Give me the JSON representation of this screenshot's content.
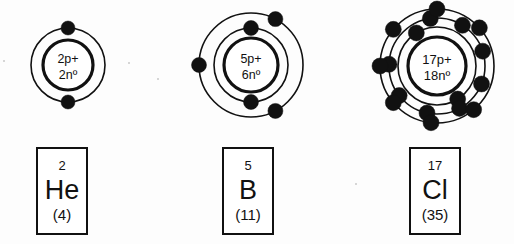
{
  "diagram": {
    "background_color": "#fdfdfd",
    "ink_color": "#111111",
    "atoms": [
      {
        "name": "helium-atom",
        "element_symbol": "He",
        "atomic_number": "2",
        "mass_number": "(4)",
        "protons_label": "2p+",
        "neutrons_label": "2nº",
        "center": {
          "x": 68,
          "y": 65
        },
        "nucleus_radius": 25,
        "shells": [
          {
            "radius": 37,
            "electron_count": 2,
            "electron_angles": [
              -90,
              90
            ]
          }
        ],
        "electron_radius": 7,
        "box": {
          "x": 36,
          "y": 147,
          "width": 52,
          "height": 88
        }
      },
      {
        "name": "boron-atom",
        "element_symbol": "B",
        "atomic_number": "5",
        "mass_number": "(11)",
        "protons_label": "5p+",
        "neutrons_label": "6nº",
        "center": {
          "x": 251,
          "y": 65
        },
        "nucleus_radius": 27,
        "shells": [
          {
            "radius": 37,
            "electron_count": 2,
            "electron_angles": [
              -90,
              90
            ]
          },
          {
            "radius": 52,
            "electron_count": 3,
            "electron_angles": [
              -62,
              180,
              62
            ]
          }
        ],
        "electron_radius": 7.5,
        "box": {
          "x": 222,
          "y": 147,
          "width": 52,
          "height": 88
        }
      },
      {
        "name": "chlorine-atom",
        "element_symbol": "Cl",
        "atomic_number": "17",
        "mass_number": "(35)",
        "protons_label": "17p+",
        "neutrons_label": "18nº",
        "center": {
          "x": 437,
          "y": 66
        },
        "nucleus_radius": 29,
        "shells": [
          {
            "radius": 39,
            "electron_count": 2,
            "electron_angles": [
              -122,
              58
            ]
          },
          {
            "radius": 48,
            "electron_count": 8,
            "electron_angles": [
              -98,
              -58,
              -18,
              22,
              62,
              102,
              142,
              182
            ]
          },
          {
            "radius": 57,
            "electron_count": 7,
            "electron_angles": [
              -90,
              -140,
              -180,
              140,
              96,
              50,
              -42
            ]
          }
        ],
        "electron_radius": 8,
        "box": {
          "x": 409,
          "y": 147,
          "width": 52,
          "height": 88
        }
      }
    ],
    "specks": [
      {
        "x": 128,
        "y": 62,
        "size": 2
      },
      {
        "x": 157,
        "y": 78,
        "size": 2
      },
      {
        "x": 3,
        "y": 60,
        "size": 2
      },
      {
        "x": 355,
        "y": 183,
        "size": 2
      }
    ]
  }
}
